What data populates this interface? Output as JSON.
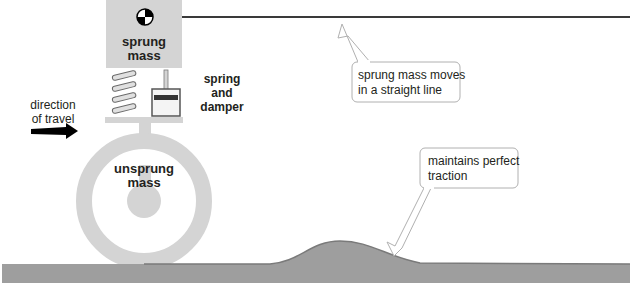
{
  "diagram": {
    "labels": {
      "sprung_mass_line1": "sprung",
      "sprung_mass_line2": "mass",
      "unsprung_mass_line1": "unsprung",
      "unsprung_mass_line2": "mass",
      "spring_damper_line1": "spring",
      "spring_damper_line2": "and",
      "spring_damper_line3": "damper",
      "direction_line1": "direction",
      "direction_line2": "of travel"
    },
    "callouts": [
      {
        "id": "straight-line",
        "line1": "sprung mass moves",
        "line2": "in a straight line"
      },
      {
        "id": "traction",
        "line1": "maintains perfect",
        "line2": "traction"
      }
    ],
    "icons": {
      "center_of_mass": "center-of-mass-icon",
      "direction_arrow": "arrow-right-icon",
      "spring": "coil-spring-icon",
      "damper": "damper-icon"
    },
    "colors": {
      "mass_fill": "#d4d4d4",
      "road_fill": "#9e9e9e",
      "road_edge": "#7a7a7a",
      "text": "#231f20",
      "callout_border": "#b0b0b0",
      "trajectory_line": "#3a3a3a"
    }
  }
}
